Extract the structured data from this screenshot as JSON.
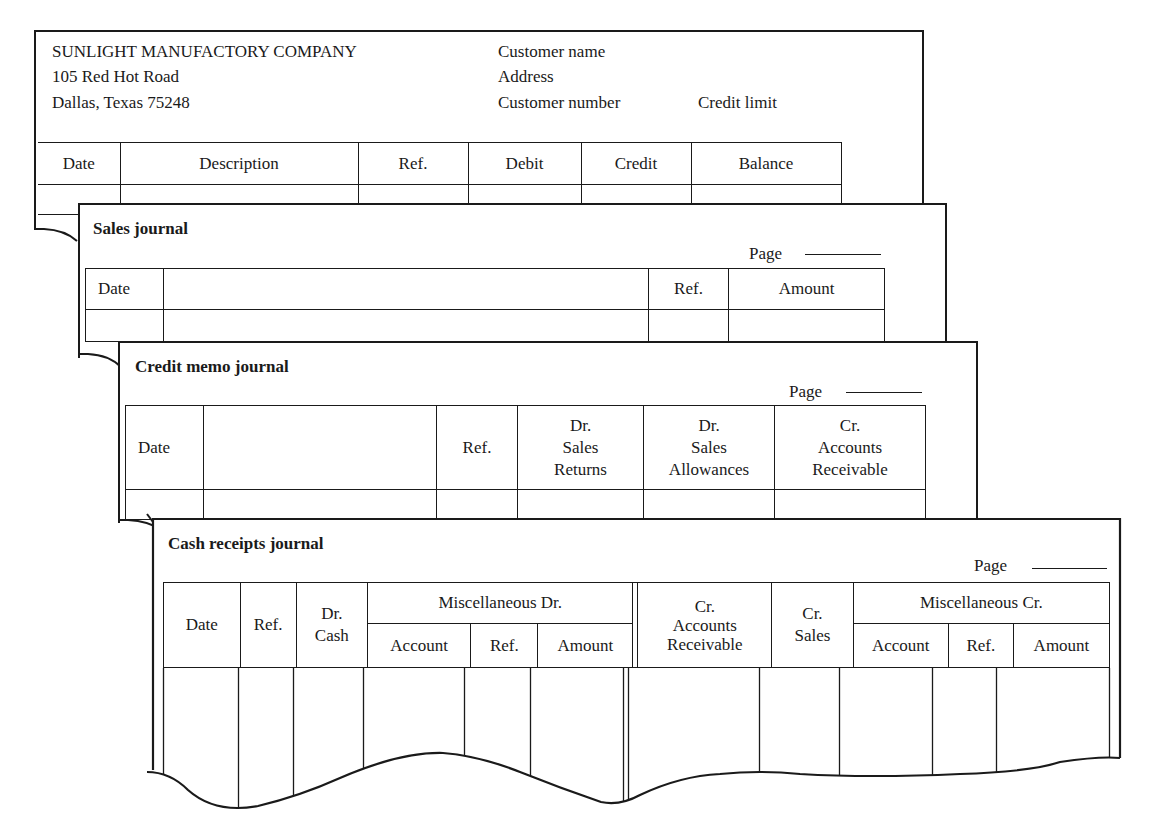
{
  "customer_ledger": {
    "company_name": "SUNLIGHT MANUFACTORY COMPANY",
    "address_line1": "105 Red Hot Road",
    "address_line2": "Dallas, Texas 75248",
    "customer_name_label": "Customer name",
    "address_label": "Address",
    "customer_number_label": "Customer number",
    "credit_limit_label": "Credit limit",
    "columns": [
      "Date",
      "Description",
      "Ref.",
      "Debit",
      "Credit",
      "Balance"
    ]
  },
  "sales_journal": {
    "title": "Sales journal",
    "page_label": "Page",
    "columns": [
      "Date",
      "",
      "Ref.",
      "Amount"
    ]
  },
  "credit_memo_journal": {
    "title": "Credit memo journal",
    "page_label": "Page",
    "columns": [
      "Date",
      "",
      "Ref.",
      "Dr.\nSales\nReturns",
      "Dr.\nSales\nAllowances",
      "Cr.\nAccounts\nReceivable"
    ],
    "col_line1": [
      "Dr.",
      "Dr.",
      "Cr."
    ],
    "col_line2": [
      "Sales",
      "Sales",
      "Accounts"
    ],
    "col_line3": [
      "Returns",
      "Allowances",
      "Receivable"
    ]
  },
  "cash_receipts_journal": {
    "title": "Cash receipts journal",
    "page_label": "Page",
    "headers": {
      "date": "Date",
      "ref": "Ref.",
      "dr_cash_1": "Dr.",
      "dr_cash_2": "Cash",
      "misc_dr": "Miscellaneous Dr.",
      "misc_dr_account": "Account",
      "misc_dr_ref": "Ref.",
      "misc_dr_amount": "Amount",
      "cr_ar_1": "Cr.",
      "cr_ar_2": "Accounts",
      "cr_ar_3": "Receivable",
      "cr_sales_1": "Cr.",
      "cr_sales_2": "Sales",
      "misc_cr": "Miscellaneous Cr.",
      "misc_cr_account": "Account",
      "misc_cr_ref": "Ref.",
      "misc_cr_amount": "Amount"
    }
  }
}
